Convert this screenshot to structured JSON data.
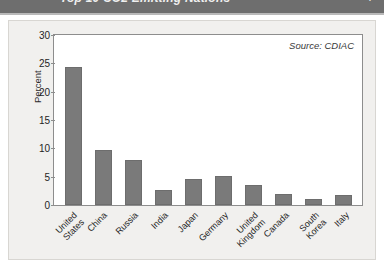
{
  "header": {
    "title": "Top 10 CO2 Emitting Nations",
    "page_number": "7"
  },
  "figure": {
    "source_note": "Source: CDIAC"
  },
  "chart_data": {
    "type": "bar",
    "title": "Top 10 CO2 Emitting Nations",
    "xlabel": "",
    "ylabel": "Percent",
    "ylim": [
      0,
      30
    ],
    "yticks": [
      0,
      5,
      10,
      15,
      20,
      25,
      30
    ],
    "ytick_labels": [
      "0",
      "5",
      "10",
      "15",
      "20",
      "25",
      "30"
    ],
    "grid": false,
    "legend": null,
    "annotations": [
      "Source: CDIAC"
    ],
    "bar_color": "#7a7a7a",
    "categories": [
      "United States",
      "China",
      "Russia",
      "India",
      "Japan",
      "Germany",
      "United Kingdom",
      "Canada",
      "South Korea",
      "Italy"
    ],
    "values": [
      24.3,
      9.7,
      8.0,
      2.7,
      4.6,
      5.2,
      3.5,
      2.0,
      1.1,
      1.7
    ]
  }
}
